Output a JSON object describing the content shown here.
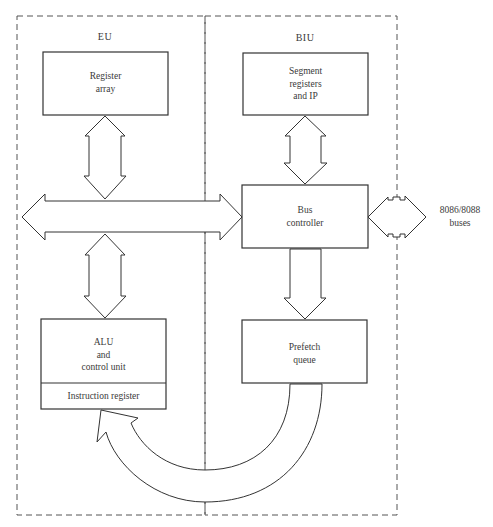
{
  "diagram": {
    "sections": {
      "eu": {
        "label": "EU"
      },
      "biu": {
        "label": "BIU"
      }
    },
    "blocks": {
      "register_array": {
        "line1": "Register",
        "line2": "array"
      },
      "segment_registers": {
        "line1": "Segment",
        "line2": "registers",
        "line3": "and IP"
      },
      "bus_controller": {
        "line1": "Bus",
        "line2": "controller"
      },
      "alu": {
        "line1": "ALU",
        "line2": "and",
        "line3": "control unit",
        "sub": "Instruction register"
      },
      "prefetch_queue": {
        "line1": "Prefetch",
        "line2": "queue"
      }
    },
    "external": {
      "line1": "8086/8088",
      "line2": "buses"
    },
    "connections": [
      {
        "from": "Register array",
        "to": "Internal bus",
        "type": "bidirectional"
      },
      {
        "from": "Segment registers and IP",
        "to": "Bus controller",
        "type": "bidirectional"
      },
      {
        "from": "Internal bus",
        "to": "Bus controller",
        "type": "bidirectional"
      },
      {
        "from": "Internal bus",
        "to": "ALU and control unit",
        "type": "bidirectional"
      },
      {
        "from": "Bus controller",
        "to": "8086/8088 buses",
        "type": "bidirectional"
      },
      {
        "from": "Bus controller",
        "to": "Prefetch queue",
        "type": "unidirectional"
      },
      {
        "from": "Prefetch queue",
        "to": "Instruction register",
        "type": "unidirectional-curved"
      }
    ],
    "colors": {
      "line": "#333333",
      "background": "#ffffff"
    }
  }
}
